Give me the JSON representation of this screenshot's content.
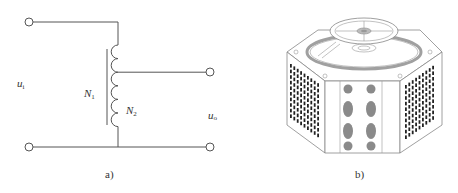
{
  "figure_a": {
    "caption": "a)",
    "input_voltage_label": "u",
    "input_voltage_sub": "i",
    "output_voltage_label": "u",
    "output_voltage_sub": "o",
    "winding1_label": "N",
    "winding1_sub": "1",
    "winding2_label": "N",
    "winding2_sub": "2",
    "coil_turns": 6,
    "tap_after_turn": 2
  },
  "figure_b": {
    "caption": "b)",
    "description": "autotransformer (variac) with rotary dial",
    "front_knob_rows": 4,
    "front_knob_columns": 2
  },
  "colors": {
    "line": "#555555",
    "device_outline": "#888888",
    "vent": "#222222",
    "knob": "#8a8a8a"
  }
}
